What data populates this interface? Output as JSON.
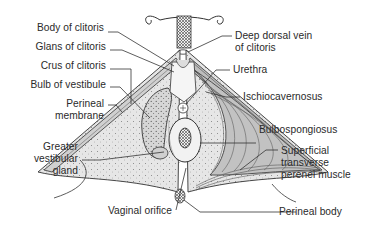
{
  "diagram": {
    "colors": {
      "outline": "#333333",
      "membrane_fill": "#e4e4e4",
      "muscle_fill": "#bdbdbd",
      "muscle_stripe": "#555555",
      "bulb_fill": "#d2d2d2",
      "orifice_fill": "#f2f2f2",
      "leader_line": "#333333",
      "text": "#2a2a2a"
    },
    "labels_left": [
      {
        "id": "body-of-clitoris",
        "text": "Body of clitoris"
      },
      {
        "id": "glans-of-clitoris",
        "text": "Glans of clitoris"
      },
      {
        "id": "crus-of-clitoris",
        "text": "Crus of clitoris"
      },
      {
        "id": "bulb-of-vestibule",
        "text": "Bulb of vestibule"
      },
      {
        "id": "perineal-membrane",
        "line1": "Perineal",
        "line2": "membrane"
      },
      {
        "id": "greater-vestibular-gland",
        "line1": "Greater",
        "line2": "vestibular",
        "line3": "gland"
      }
    ],
    "labels_right": [
      {
        "id": "deep-dorsal-vein",
        "line1": "Deep dorsal vein",
        "line2": "of clitoris"
      },
      {
        "id": "urethra",
        "text": "Urethra"
      },
      {
        "id": "ischiocavernosus",
        "text": "Ischiocavernosus"
      },
      {
        "id": "bulbospongiosus",
        "text": "Bulbospongiosus"
      },
      {
        "id": "superficial-transverse",
        "line1": "Superficial",
        "line2": "transverse",
        "line3": "perenei muscle"
      }
    ],
    "labels_bottom": [
      {
        "id": "vaginal-orifice",
        "text": "Vaginal orifice"
      },
      {
        "id": "perineal-body",
        "text": "Perineal body"
      }
    ]
  }
}
